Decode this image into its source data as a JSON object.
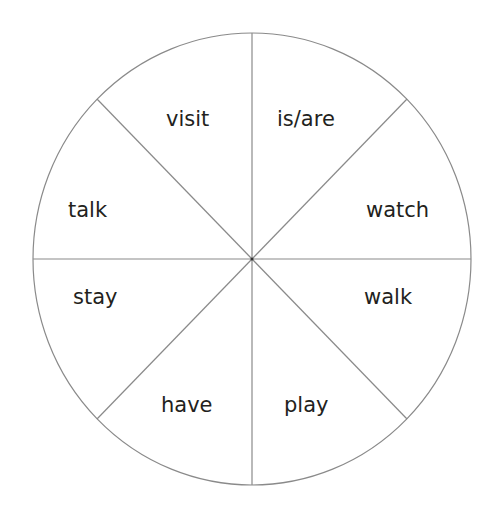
{
  "diagram": {
    "type": "verb-wheel",
    "segments": 8,
    "colors": {
      "background": "#ffffff",
      "stroke": "#8a8a8a",
      "text": "#231f20"
    },
    "labels": {
      "top_left": "visit",
      "top_right": "is/are",
      "upper_right": "watch",
      "lower_right": "walk",
      "bottom_right": "play",
      "bottom_left": "have",
      "lower_left": "stay",
      "upper_left": "talk"
    }
  }
}
